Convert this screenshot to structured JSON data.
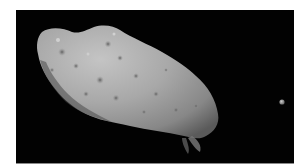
{
  "image": {
    "subject": "asteroid",
    "description": "Grayscale space photograph of an elongated cratered asteroid with a small moon to the right against a black background",
    "colors": {
      "background": "#020202",
      "page": "#ffffff",
      "asteroid_light": "#b5b5b5",
      "asteroid_mid": "#8e8e8e",
      "asteroid_dark": "#4a4a4a",
      "moon": "#9a9a9a"
    }
  }
}
